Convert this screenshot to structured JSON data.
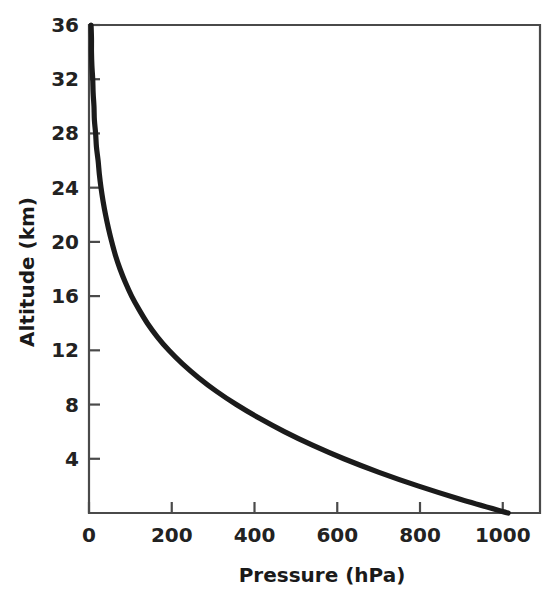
{
  "chart_data": {
    "type": "line",
    "title": "",
    "xlabel": "Pressure (hPa)",
    "ylabel": "Altitude (km)",
    "xlim": [
      0,
      1090
    ],
    "ylim": [
      0,
      36
    ],
    "grid": false,
    "legend": false,
    "x_ticks": [
      0,
      200,
      400,
      600,
      800,
      1000
    ],
    "x_tick_labels": [
      "0",
      "200",
      "400",
      "600",
      "800",
      "1000"
    ],
    "y_ticks": [
      4,
      8,
      12,
      16,
      20,
      24,
      28,
      32,
      36
    ],
    "y_tick_labels": [
      "4",
      "8",
      "12",
      "16",
      "20",
      "24",
      "28",
      "32",
      "36"
    ],
    "series": [
      {
        "name": "Standard atmosphere pressure profile",
        "color": "#1b1b1b",
        "x_is": "pressure_hPa",
        "y_is": "altitude_km",
        "points": [
          {
            "altitude_km": 0,
            "pressure_hPa": 1013
          },
          {
            "altitude_km": 1,
            "pressure_hPa": 899
          },
          {
            "altitude_km": 2,
            "pressure_hPa": 795
          },
          {
            "altitude_km": 3,
            "pressure_hPa": 701
          },
          {
            "altitude_km": 4,
            "pressure_hPa": 616
          },
          {
            "altitude_km": 5,
            "pressure_hPa": 540
          },
          {
            "altitude_km": 6,
            "pressure_hPa": 472
          },
          {
            "altitude_km": 7,
            "pressure_hPa": 411
          },
          {
            "altitude_km": 8,
            "pressure_hPa": 356
          },
          {
            "altitude_km": 9,
            "pressure_hPa": 307
          },
          {
            "altitude_km": 10,
            "pressure_hPa": 264
          },
          {
            "altitude_km": 11,
            "pressure_hPa": 226
          },
          {
            "altitude_km": 12,
            "pressure_hPa": 193
          },
          {
            "altitude_km": 13,
            "pressure_hPa": 165
          },
          {
            "altitude_km": 14,
            "pressure_hPa": 141
          },
          {
            "altitude_km": 15,
            "pressure_hPa": 121
          },
          {
            "altitude_km": 16,
            "pressure_hPa": 103
          },
          {
            "altitude_km": 17,
            "pressure_hPa": 88
          },
          {
            "altitude_km": 18,
            "pressure_hPa": 75
          },
          {
            "altitude_km": 19,
            "pressure_hPa": 64
          },
          {
            "altitude_km": 20,
            "pressure_hPa": 55
          },
          {
            "altitude_km": 21,
            "pressure_hPa": 47
          },
          {
            "altitude_km": 22,
            "pressure_hPa": 40
          },
          {
            "altitude_km": 23,
            "pressure_hPa": 34
          },
          {
            "altitude_km": 24,
            "pressure_hPa": 29
          },
          {
            "altitude_km": 25,
            "pressure_hPa": 25
          },
          {
            "altitude_km": 26,
            "pressure_hPa": 22
          },
          {
            "altitude_km": 27,
            "pressure_hPa": 18
          },
          {
            "altitude_km": 28,
            "pressure_hPa": 16
          },
          {
            "altitude_km": 29,
            "pressure_hPa": 13
          },
          {
            "altitude_km": 30,
            "pressure_hPa": 12
          },
          {
            "altitude_km": 31,
            "pressure_hPa": 10
          },
          {
            "altitude_km": 32,
            "pressure_hPa": 9
          },
          {
            "altitude_km": 33,
            "pressure_hPa": 7
          },
          {
            "altitude_km": 34,
            "pressure_hPa": 6
          },
          {
            "altitude_km": 35,
            "pressure_hPa": 6
          },
          {
            "altitude_km": 36,
            "pressure_hPa": 5
          }
        ]
      }
    ]
  },
  "axes": {
    "x_title": "Pressure (hPa)",
    "y_title": "Altitude (km)"
  }
}
